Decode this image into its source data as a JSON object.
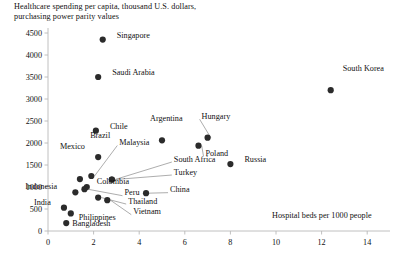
{
  "chart_data": {
    "type": "scatter",
    "title": "Healthcare spending per capita, thousand U.S. dollars,\npurchasing power parity values",
    "xlabel": "Hospital beds per 1000 people",
    "ylabel": "",
    "xlim": [
      0,
      15
    ],
    "ylim": [
      0,
      4500
    ],
    "xticks": [
      "0",
      "2",
      "4",
      "6",
      "8",
      "10",
      "12",
      "14"
    ],
    "xtick_values": [
      0,
      2,
      4,
      6,
      8,
      10,
      12,
      14
    ],
    "yticks": [
      "0",
      "500",
      "1000",
      "1500",
      "2000",
      "2500",
      "3000",
      "3500",
      "4000",
      "4500"
    ],
    "ytick_values": [
      0,
      500,
      1000,
      1500,
      2000,
      2500,
      3000,
      3500,
      4000,
      4500
    ],
    "grid": false,
    "legend": "none",
    "points": [
      {
        "label": "Singapore",
        "x": 2.4,
        "y": 4350,
        "lx": 14,
        "ly": -5,
        "leader": false
      },
      {
        "label": "Saudi Arabia",
        "x": 2.2,
        "y": 3500,
        "lx": 14,
        "ly": -5,
        "leader": false
      },
      {
        "label": "South Korea",
        "x": 12.4,
        "y": 3200,
        "lx": 12,
        "ly": -22,
        "leader": false
      },
      {
        "label": "Chile",
        "x": 2.1,
        "y": 2280,
        "lx": 14,
        "ly": -5,
        "leader": false
      },
      {
        "label": "Argentina",
        "x": 5.0,
        "y": 2060,
        "lx": -12,
        "ly": -22,
        "leader": false
      },
      {
        "label": "Hungary",
        "x": 7.0,
        "y": 2120,
        "lx": -6,
        "ly": -22,
        "leader": true
      },
      {
        "label": "Poland",
        "x": 6.6,
        "y": 1940,
        "lx": 7,
        "ly": 7,
        "leader": true
      },
      {
        "label": "Brazil",
        "x": 2.2,
        "y": 1680,
        "lx": -8,
        "ly": -22,
        "leader": false
      },
      {
        "label": "Mexico",
        "x": 1.4,
        "y": 1180,
        "lx": -20,
        "ly": -33,
        "leader": false
      },
      {
        "label": "Malaysia",
        "x": 1.9,
        "y": 1250,
        "lx": 28,
        "ly": -34,
        "leader": true
      },
      {
        "label": "South Africa",
        "x": 2.8,
        "y": 1170,
        "lx": 62,
        "ly": -21,
        "leader": true
      },
      {
        "label": "Russia",
        "x": 8.0,
        "y": 1520,
        "lx": 14,
        "ly": -5,
        "leader": false
      },
      {
        "label": "Turkey",
        "x": 2.8,
        "y": 1170,
        "lx": 62,
        "ly": -8,
        "leader": true
      },
      {
        "label": "Colombia",
        "x": 1.7,
        "y": 1000,
        "lx": 10,
        "ly": -6,
        "leader": false
      },
      {
        "label": "China",
        "x": 4.3,
        "y": 860,
        "lx": 24,
        "ly": -4,
        "leader": true
      },
      {
        "label": "Indonesia",
        "x": 1.2,
        "y": 880,
        "lx": -50,
        "ly": -6,
        "leader": false
      },
      {
        "label": "Peru",
        "x": 1.6,
        "y": 950,
        "lx": 40,
        "ly": 3,
        "leader": true
      },
      {
        "label": "Thailand",
        "x": 2.2,
        "y": 760,
        "lx": 30,
        "ly": 3,
        "leader": true
      },
      {
        "label": "Vietnam",
        "x": 2.6,
        "y": 700,
        "lx": 26,
        "ly": 11,
        "leader": true
      },
      {
        "label": "India",
        "x": 0.7,
        "y": 530,
        "lx": -30,
        "ly": -6,
        "leader": false
      },
      {
        "label": "Philippines",
        "x": 1.0,
        "y": 400,
        "lx": 8,
        "ly": 4,
        "leader": false
      },
      {
        "label": "Bangladesh",
        "x": 0.8,
        "y": 180,
        "lx": 6,
        "ly": 0,
        "leader": false
      }
    ]
  }
}
